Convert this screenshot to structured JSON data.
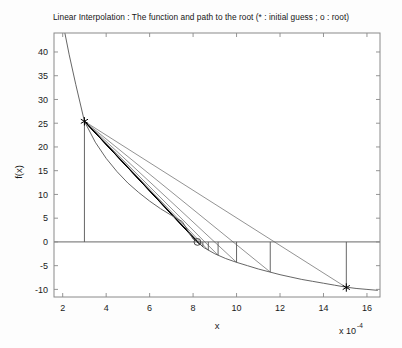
{
  "chart_data": {
    "type": "line",
    "title": "Linear Interpolation : The function and path to the root (* : initial guess ; o : root)",
    "xlabel": "x",
    "ylabel": "f(x)",
    "x_exponent_prefix": "x 10",
    "x_exponent_power": "-4",
    "x_scale_factor": 0.0001,
    "xlim": [
      1.6,
      16.6
    ],
    "ylim": [
      -11.6,
      44.0
    ],
    "xticks": [
      2,
      4,
      6,
      8,
      10,
      12,
      14,
      16
    ],
    "xticklabels": [
      "2",
      "4",
      "6",
      "8",
      "10",
      "12",
      "14",
      "16"
    ],
    "yticks": [
      -10,
      -5,
      0,
      5,
      10,
      15,
      20,
      25,
      30,
      35,
      40
    ],
    "yticklabels": [
      "-10",
      "-5",
      "0",
      "5",
      "10",
      "15",
      "20",
      "25",
      "30",
      "35",
      "40"
    ],
    "grid": false,
    "box": true,
    "tick_direction": "in",
    "line_color": "#555555",
    "bold_line_color": "#000000",
    "axis_color": "#808080",
    "series": [
      {
        "name": "function",
        "role": "curve",
        "comment": "Monotone decreasing function f(x) crossing zero near x=8.2e-4",
        "x": [
          2.1,
          2.3,
          2.6,
          3.0,
          3.5,
          4.0,
          4.5,
          5.0,
          5.5,
          6.0,
          6.5,
          7.0,
          7.5,
          8.0,
          8.2,
          8.5,
          9.0,
          9.5,
          10.0,
          10.5,
          11.0,
          11.5,
          12.0,
          12.5,
          13.0,
          13.5,
          14.0,
          14.5,
          15.0,
          15.5,
          16.0,
          16.5
        ],
        "y": [
          44.0,
          39.4,
          33.2,
          25.4,
          21.0,
          17.6,
          14.8,
          12.4,
          10.4,
          8.6,
          7.0,
          5.6,
          4.3,
          0.6,
          0.0,
          -1.2,
          -2.5,
          -3.5,
          -4.3,
          -5.0,
          -5.7,
          -6.3,
          -6.9,
          -7.4,
          -7.9,
          -8.3,
          -8.7,
          -9.1,
          -9.5,
          -9.8,
          -10.0,
          -10.2
        ]
      },
      {
        "name": "secant-lines",
        "role": "interpolation-chords",
        "comment": "Chords drawn from fixed left endpoint (3.0, 25.4) to each successive right bracket point",
        "anchor": {
          "x": 3.0,
          "y": 25.4
        },
        "targets": [
          {
            "x": 15.05,
            "y": -9.6
          },
          {
            "x": 11.55,
            "y": -6.35
          },
          {
            "x": 10.0,
            "y": -4.3
          },
          {
            "x": 9.15,
            "y": -2.8
          },
          {
            "x": 8.7,
            "y": -1.75
          },
          {
            "x": 8.45,
            "y": -1.05
          },
          {
            "x": 8.33,
            "y": -0.62
          },
          {
            "x": 8.26,
            "y": -0.33
          },
          {
            "x": 8.22,
            "y": -0.15
          }
        ]
      },
      {
        "name": "drop-lines",
        "role": "vertical-connectors",
        "comment": "Vertical segments from the zero axis down to each iterate on the curve",
        "x_positions": [
          15.05,
          11.55,
          10.0,
          9.15,
          8.7,
          8.45
        ],
        "y_top": 0,
        "y_bottom_values": [
          -9.6,
          -6.35,
          -4.3,
          -2.8,
          -1.75,
          -1.05
        ]
      },
      {
        "name": "zero-axis",
        "role": "horizontal-reference",
        "y": 0,
        "x_from": 1.6,
        "x_to": 16.6
      },
      {
        "name": "left-bracket-vertical",
        "role": "vertical-reference",
        "x": 3.0,
        "y_from": 0,
        "y_to": 25.4
      }
    ],
    "markers": [
      {
        "name": "initial-guess-left",
        "symbol": "*",
        "x": 3.0,
        "y": 25.4,
        "label": "initial guess"
      },
      {
        "name": "initial-guess-right",
        "symbol": "*",
        "x": 15.05,
        "y": -9.6,
        "label": "initial guess"
      },
      {
        "name": "root",
        "symbol": "o",
        "x": 8.2,
        "y": 0.0,
        "label": "root"
      }
    ],
    "legend": {
      "position": "in-title",
      "entries": [
        {
          "symbol": "*",
          "label": "initial guess"
        },
        {
          "symbol": "o",
          "label": "root"
        }
      ]
    }
  }
}
